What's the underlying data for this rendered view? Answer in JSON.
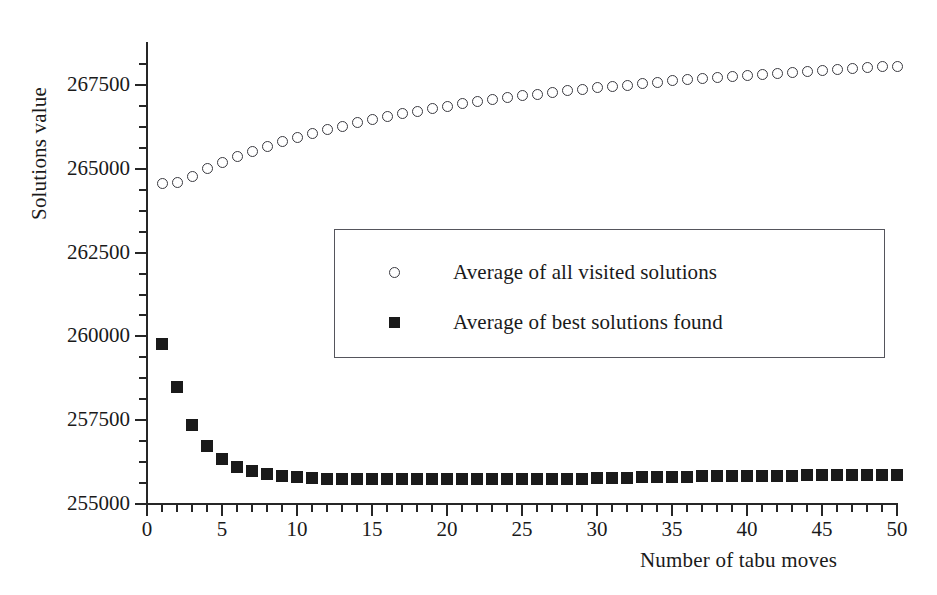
{
  "chart_data": {
    "type": "scatter",
    "title": "",
    "xlabel": "Number of tabu moves",
    "ylabel": "Solutions value",
    "xlim": [
      0,
      50
    ],
    "ylim": [
      255000,
      268500
    ],
    "grid": false,
    "legend_position": "center",
    "x_ticks_major": [
      0,
      5,
      10,
      15,
      20,
      25,
      30,
      35,
      40,
      45,
      50
    ],
    "x_tick_labels": [
      "0",
      "5",
      "10",
      "15",
      "20",
      "25",
      "30",
      "35",
      "40",
      "45",
      "50"
    ],
    "x_tick_minor_step": 1,
    "y_ticks_major": [
      255000,
      257500,
      260000,
      262500,
      265000,
      267500
    ],
    "y_tick_labels": [
      "255000",
      "257500",
      "260000",
      "262500",
      "265000",
      "267500"
    ],
    "y_tick_minor_step": 625,
    "x": [
      1,
      2,
      3,
      4,
      5,
      6,
      7,
      8,
      9,
      10,
      11,
      12,
      13,
      14,
      15,
      16,
      17,
      18,
      19,
      20,
      21,
      22,
      23,
      24,
      25,
      26,
      27,
      28,
      29,
      30,
      31,
      32,
      33,
      34,
      35,
      36,
      37,
      38,
      39,
      40,
      41,
      42,
      43,
      44,
      45,
      46,
      47,
      48,
      49,
      50
    ],
    "series": [
      {
        "name": "Average of all visited solutions",
        "marker": "open-circle",
        "color": "#3a3a40",
        "values": [
          264560,
          264580,
          264760,
          265000,
          265190,
          265360,
          265520,
          265660,
          265800,
          265930,
          266050,
          266160,
          266270,
          266370,
          266470,
          266560,
          266640,
          266720,
          266800,
          266870,
          266940,
          267000,
          267060,
          267120,
          267180,
          267230,
          267280,
          267330,
          267380,
          267420,
          267460,
          267500,
          267540,
          267580,
          267620,
          267660,
          267700,
          267730,
          267760,
          267790,
          267820,
          267850,
          267880,
          267910,
          267940,
          267960,
          267990,
          268010,
          268040,
          268060
        ]
      },
      {
        "name": "Average of best solutions found",
        "marker": "filled-square",
        "color": "#1a1a1a",
        "values": [
          259780,
          258480,
          257350,
          256730,
          256330,
          256100,
          255980,
          255900,
          255840,
          255800,
          255770,
          255750,
          255740,
          255740,
          255740,
          255750,
          255760,
          255750,
          255750,
          255750,
          255750,
          255760,
          255760,
          255750,
          255750,
          255750,
          255750,
          255750,
          255760,
          255770,
          255780,
          255790,
          255800,
          255800,
          255810,
          255820,
          255830,
          255830,
          255840,
          255840,
          255850,
          255850,
          255850,
          255860,
          255860,
          255860,
          255870,
          255870,
          255870,
          255870
        ]
      }
    ]
  },
  "legend": {
    "entries": [
      {
        "label": "Average of all visited solutions",
        "marker": "open-circle"
      },
      {
        "label": "Average of best solutions found",
        "marker": "filled-square"
      }
    ]
  }
}
